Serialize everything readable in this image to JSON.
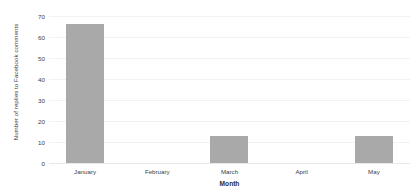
{
  "chart_data": {
    "type": "bar",
    "title": "",
    "xlabel": "Month",
    "ylabel": "Number of replies to Facebook comments",
    "categories": [
      "January",
      "February",
      "March",
      "April",
      "May"
    ],
    "values": [
      66,
      0,
      13,
      0,
      13
    ],
    "ylim": [
      0,
      70
    ],
    "ytick_labels": [
      "0",
      "10",
      "20",
      "30",
      "40",
      "50",
      "60",
      "70"
    ],
    "ytick_values": [
      0,
      10,
      20,
      30,
      40,
      50,
      60,
      70
    ],
    "grid": true,
    "legend": "none",
    "bar_color": "#a9a9a9",
    "gridline_color": "#f2f2f2",
    "text_color": "#3c3c3c",
    "background_color": "#ffffff"
  }
}
